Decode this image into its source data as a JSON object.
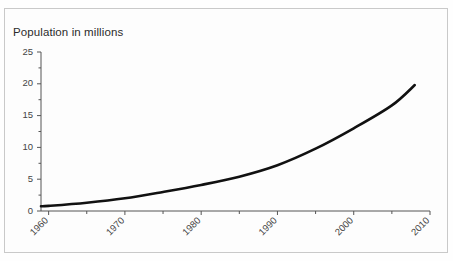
{
  "chart_data": {
    "type": "line",
    "title": "Population in millions",
    "xlabel": "",
    "ylabel": "",
    "xlim": [
      1959,
      2010
    ],
    "ylim": [
      0,
      25
    ],
    "grid": false,
    "legend": null,
    "x_tick_labels": [
      "1960",
      "1970",
      "1980",
      "1990",
      "2000",
      "2010"
    ],
    "x_major_ticks": [
      1960,
      1970,
      1980,
      1990,
      2000,
      2010
    ],
    "x_minor_ticks": [
      1965,
      1975,
      1985,
      1995,
      2005
    ],
    "y_tick_labels": [
      "0",
      "5",
      "10",
      "15",
      "20",
      "25"
    ],
    "y_major_ticks": [
      0,
      5,
      10,
      15,
      20,
      25
    ],
    "y_minor_ticks": [
      2.5,
      7.5,
      12.5,
      17.5,
      22.5
    ],
    "x": [
      1959,
      1960,
      1965,
      1970,
      1975,
      1980,
      1985,
      1990,
      1995,
      2000,
      2005,
      2008
    ],
    "values": [
      0.75,
      0.8,
      1.3,
      2.0,
      3.0,
      4.1,
      5.4,
      7.2,
      9.8,
      13.0,
      16.6,
      19.8
    ],
    "series": [
      {
        "name": "Population",
        "color": "#111111",
        "values": [
          0.75,
          0.8,
          1.3,
          2.0,
          3.0,
          4.1,
          5.4,
          7.2,
          9.8,
          13.0,
          16.6,
          19.8
        ]
      }
    ]
  },
  "colors": {
    "line": "#111111",
    "axis": "#555555",
    "text": "#2b2b2b",
    "frame": "#c9c9c9",
    "background": "#fdfdfd"
  }
}
